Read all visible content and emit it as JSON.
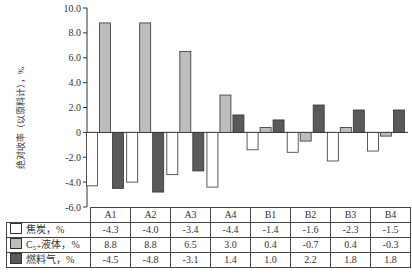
{
  "chart_data": {
    "type": "bar",
    "title": "",
    "xlabel": "",
    "ylabel": "绝对收率（以原料计），%",
    "ylim": [
      -6.0,
      10.0
    ],
    "yticks": [
      10.0,
      8.0,
      6.0,
      4.0,
      2.0,
      0,
      -2.0,
      -4.0,
      -6.0
    ],
    "ytick_labels": [
      "10.0",
      "8.0",
      "6.0",
      "4.0",
      "2.0",
      "0",
      "-2.0",
      "-4.0",
      "-6.0"
    ],
    "grid": false,
    "legend_position": "table-below",
    "categories": [
      "A1",
      "A2",
      "A3",
      "A4",
      "B1",
      "B2",
      "B3",
      "B4"
    ],
    "series": [
      {
        "name": "焦炭，%",
        "color": "#ffffff",
        "values": [
          -4.3,
          -4.0,
          -3.4,
          -4.4,
          -1.4,
          -1.6,
          -2.3,
          -1.5
        ]
      },
      {
        "name": "C₅₊液体，%",
        "color": "#bdbdbd",
        "values": [
          8.8,
          8.8,
          6.5,
          3.0,
          0.4,
          -0.7,
          0.4,
          -0.3
        ]
      },
      {
        "name": "燃料气，%",
        "color": "#5a5a5a",
        "values": [
          -4.5,
          -4.8,
          -3.1,
          1.4,
          1.0,
          2.2,
          1.8,
          1.8
        ]
      }
    ]
  },
  "table": {
    "headers": [
      "A1",
      "A2",
      "A3",
      "A4",
      "B1",
      "B2",
      "B3",
      "B4"
    ],
    "rows": [
      {
        "label": "焦炭，%",
        "swatch": "#ffffff",
        "cells": [
          "-4.3",
          "-4.0",
          "-3.4",
          "-4.4",
          "-1.4",
          "-1.6",
          "-2.3",
          "-1.5"
        ]
      },
      {
        "label": "C₅₊液体，%",
        "swatch": "#bdbdbd",
        "cells": [
          "8.8",
          "8.8",
          "6.5",
          "3.0",
          "0.4",
          "-0.7",
          "0.4",
          "-0.3"
        ]
      },
      {
        "label": "燃料气，%",
        "swatch": "#5a5a5a",
        "cells": [
          "-4.5",
          "-4.8",
          "-3.1",
          "1.4",
          "1.0",
          "2.2",
          "1.8",
          "1.8"
        ]
      }
    ]
  }
}
